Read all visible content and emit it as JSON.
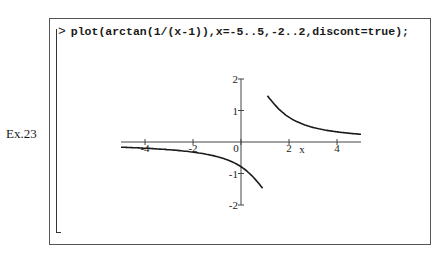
{
  "example_label": "Ex.23",
  "worksheet": {
    "prompt_symbol": ">",
    "command": "plot(arctan(1/(x-1)),x=-5..5,-2..2,discont=true);"
  },
  "chart_data": {
    "type": "line",
    "title": "",
    "function": "arctan(1/(x-1))",
    "xlabel": "x",
    "ylabel": "",
    "xlim": [
      -5,
      5
    ],
    "ylim": [
      -2,
      2
    ],
    "discontinuity": 1,
    "x_ticks": [
      -4,
      -2,
      0,
      2,
      4
    ],
    "x_tick_labels": [
      "-4",
      "-2",
      "0",
      "2",
      "4"
    ],
    "y_ticks": [
      -2,
      -1,
      1,
      2
    ],
    "y_tick_labels": [
      "-2",
      "-1",
      "1",
      "2"
    ],
    "grid": false,
    "legend": null,
    "series": [
      {
        "name": "left branch",
        "x": [
          -5,
          -4,
          -3,
          -2,
          -1,
          -0.5,
          0,
          0.5,
          0.9
        ],
        "y": [
          -0.165,
          -0.197,
          -0.245,
          -0.322,
          -0.464,
          -0.588,
          -0.785,
          -1.107,
          -1.471
        ]
      },
      {
        "name": "right branch",
        "x": [
          1.1,
          1.5,
          2,
          3,
          4,
          5
        ],
        "y": [
          1.471,
          1.107,
          0.785,
          0.464,
          0.322,
          0.245
        ]
      }
    ],
    "colors": {
      "curve": "#1a1a1a",
      "axes": "#444444"
    }
  }
}
